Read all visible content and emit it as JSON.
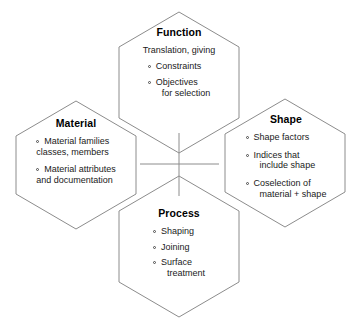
{
  "diagram": {
    "type": "overlapping-hexagon-venn",
    "background_color": "#ffffff",
    "stroke_color": "#8c8c8c",
    "text_color": "#1a1a1a",
    "bullet_glyph": "hollow-circle",
    "hexagons": [
      {
        "id": "function",
        "title": "Function",
        "position": "top",
        "lead": "Translation, giving",
        "items": [
          "Constraints",
          "Objectives\nfor selection"
        ]
      },
      {
        "id": "material",
        "title": "Material",
        "position": "left",
        "lead": "",
        "items": [
          "Material families\nclasses, members",
          "Material attributes\nand documentation"
        ]
      },
      {
        "id": "shape",
        "title": "Shape",
        "position": "right",
        "lead": "",
        "items": [
          "Shape factors",
          "Indices that\ninclude shape",
          "Coselection of\nmaterial + shape"
        ]
      },
      {
        "id": "process",
        "title": "Process",
        "position": "bottom",
        "lead": "",
        "items": [
          "Shaping",
          "Joining",
          "Surface\ntreatment"
        ]
      }
    ]
  },
  "function": {
    "title": "Function",
    "lead": "Translation, giving",
    "item0_line0": "Constraints",
    "item1_line0": "Objectives",
    "item1_line1": "for selection"
  },
  "material": {
    "title": "Material",
    "item0_line0": "Material families",
    "item0_line1": "classes, members",
    "item1_line0": "Material attributes",
    "item1_line1": "and documentation"
  },
  "shape": {
    "title": "Shape",
    "item0_line0": "Shape factors",
    "item1_line0": "Indices that",
    "item1_line1": "include shape",
    "item2_line0": "Coselection of",
    "item2_line1": "material + shape"
  },
  "process": {
    "title": "Process",
    "item0_line0": "Shaping",
    "item1_line0": "Joining",
    "item2_line0": "Surface",
    "item2_line1": "treatment"
  }
}
